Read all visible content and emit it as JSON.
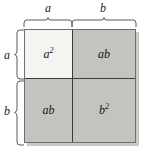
{
  "top_braces": [
    {
      "label": "a",
      "name": "top-brace-a",
      "segment": "left",
      "span_fraction": 0.43
    },
    {
      "label": "b",
      "name": "top-brace-b",
      "segment": "right",
      "span_fraction": 0.57
    }
  ],
  "left_braces": [
    {
      "label": "a",
      "name": "left-brace-a",
      "segment": "top",
      "span_fraction": 0.43
    },
    {
      "label": "b",
      "name": "left-brace-b",
      "segment": "bottom",
      "span_fraction": 0.57
    }
  ],
  "cells": {
    "top_left": {
      "base": "a",
      "exponent": "2",
      "full": "a²",
      "fill": "#f4f4f1"
    },
    "top_right": {
      "base": "ab",
      "exponent": "",
      "full": "ab",
      "fill": "#c3c3bf"
    },
    "bottom_left": {
      "base": "ab",
      "exponent": "",
      "full": "ab",
      "fill": "#c3c3bf"
    },
    "bottom_right": {
      "base": "b",
      "exponent": "2",
      "full": "b²",
      "fill": "#c3c3bf"
    }
  },
  "colors": {
    "light_fill": "#f4f4f1",
    "gray_fill": "#c3c3bf",
    "inner_line": "#3a3a3a",
    "outer_border": "#6f6f6f",
    "shadow": "#c9c9c5",
    "brace_stroke": "#5a5a5a",
    "text": "#151515",
    "background": "#ffffff"
  }
}
